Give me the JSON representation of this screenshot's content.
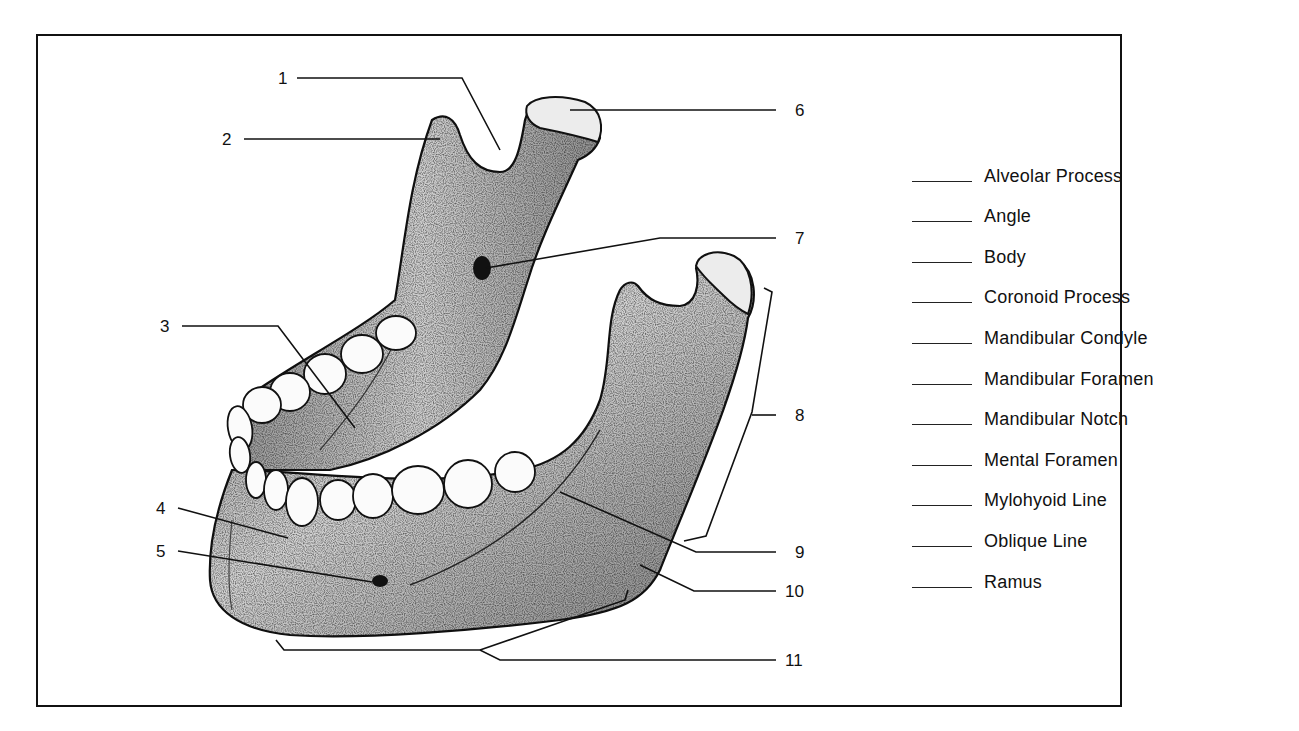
{
  "diagram": {
    "numbered_labels": [
      {
        "number": "1",
        "points_to": "Mandibular Notch"
      },
      {
        "number": "2",
        "points_to": "Coronoid Process"
      },
      {
        "number": "3",
        "points_to": "Mylohyoid Line"
      },
      {
        "number": "4",
        "points_to": "Body"
      },
      {
        "number": "5",
        "points_to": "Mental Foramen"
      },
      {
        "number": "6",
        "points_to": "Mandibular Condyle"
      },
      {
        "number": "7",
        "points_to": "Mandibular Foramen"
      },
      {
        "number": "8",
        "points_to": "Ramus"
      },
      {
        "number": "9",
        "points_to": "Alveolar Process"
      },
      {
        "number": "10",
        "points_to": "Oblique Line"
      },
      {
        "number": "11",
        "points_to": "Angle"
      }
    ]
  },
  "labels": {
    "l1": "1",
    "l2": "2",
    "l3": "3",
    "l4": "4",
    "l5": "5",
    "l6": "6",
    "l7": "7",
    "l8": "8",
    "l9": "9",
    "l10": "10",
    "l11": "11"
  },
  "word_bank": {
    "blank": "______",
    "items": [
      {
        "term": "Alveolar Process",
        "answer": ""
      },
      {
        "term": "Angle",
        "answer": ""
      },
      {
        "term": "Body",
        "answer": ""
      },
      {
        "term": "Coronoid Process",
        "answer": ""
      },
      {
        "term": "Mandibular Condyle",
        "answer": ""
      },
      {
        "term": "Mandibular Foramen",
        "answer": ""
      },
      {
        "term": "Mandibular Notch",
        "answer": ""
      },
      {
        "term": "Mental Foramen",
        "answer": ""
      },
      {
        "term": "Mylohyoid Line",
        "answer": ""
      },
      {
        "term": "Oblique Line",
        "answer": ""
      },
      {
        "term": "Ramus",
        "answer": ""
      }
    ]
  },
  "colors": {
    "ink": "#111111",
    "bone_fill": "#c9c9c9",
    "bone_dark": "#8a8a8a",
    "tooth_fill": "#fbfbfb",
    "background": "#ffffff"
  }
}
